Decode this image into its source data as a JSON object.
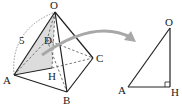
{
  "figure": {
    "pyramid": {
      "vertices": {
        "O": {
          "label": "O",
          "x": 55,
          "y": 12
        },
        "A": {
          "label": "A",
          "x": 14,
          "y": 75
        },
        "B": {
          "label": "B",
          "x": 67,
          "y": 92
        },
        "C": {
          "label": "C",
          "x": 93,
          "y": 58
        },
        "D": {
          "label": "D",
          "x": 47,
          "y": 40
        },
        "H": {
          "label": "H",
          "x": 52,
          "y": 68
        }
      },
      "edge_length_label": "5"
    },
    "triangle": {
      "vertices": {
        "O": {
          "label": "O",
          "x": 170,
          "y": 28
        },
        "A": {
          "label": "A",
          "x": 128,
          "y": 87
        },
        "H": {
          "label": "H",
          "x": 170,
          "y": 87
        }
      }
    },
    "colors": {
      "line": "#222222",
      "shade": "#d9d9d9",
      "arrow": "#a6a6a6",
      "dashed": "#555555"
    }
  }
}
